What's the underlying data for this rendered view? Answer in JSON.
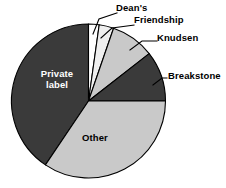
{
  "chart_data": {
    "type": "pie",
    "title": "",
    "xlabel": "",
    "ylabel": "",
    "legend_position": "none",
    "grid": false,
    "categories": [
      "Private label",
      "Dean's",
      "Friendship",
      "Knudsen",
      "Breakstone",
      "Other"
    ],
    "values": [
      40.6,
      2.2,
      3.1,
      9.2,
      7.5,
      34.4
    ],
    "units": "percent of market share",
    "start_angle_deg": 0,
    "direction": "clockwise",
    "slices": [
      {
        "label": "Private label",
        "value": 40.6,
        "color": "#3a3a3a",
        "text_color": "#ffffff",
        "label_placement": "inside",
        "start_deg": 214,
        "end_deg": 360
      },
      {
        "label": "Dean's",
        "value": 2.2,
        "color": "#ffffff",
        "text_color": "#000000",
        "label_placement": "callout",
        "start_deg": 0,
        "end_deg": 8
      },
      {
        "label": "Friendship",
        "value": 3.1,
        "color": "#efefef",
        "text_color": "#000000",
        "label_placement": "callout",
        "start_deg": 8,
        "end_deg": 19
      },
      {
        "label": "Knudsen",
        "value": 9.2,
        "color": "#c9c9c9",
        "text_color": "#000000",
        "label_placement": "callout",
        "start_deg": 19,
        "end_deg": 52
      },
      {
        "label": "Breakstone",
        "value": 7.5,
        "color": "#3a3a3a",
        "text_color": "#000000",
        "label_placement": "callout",
        "start_deg": 52,
        "end_deg": 90
      },
      {
        "label": "Other",
        "value": 34.4,
        "color": "#c9c9c9",
        "text_color": "#000000",
        "label_placement": "inside",
        "start_deg": 90,
        "end_deg": 214
      }
    ]
  },
  "labels": {
    "deans": "Dean's",
    "friendship": "Friendship",
    "knudsen": "Knudsen",
    "breakstone": "Breakstone",
    "private_label_line1": "Private",
    "private_label_line2": "label",
    "other": "Other"
  },
  "title_fragment": "",
  "colors": {
    "dark_slice": "#3a3a3a",
    "light_slice": "#c9c9c9",
    "pale_slice": "#efefef",
    "white_slice": "#ffffff",
    "outline": "#000000",
    "background": "#ffffff"
  }
}
